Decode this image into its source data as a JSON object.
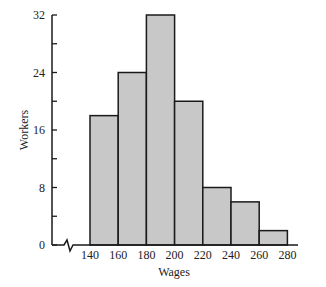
{
  "chart_data": {
    "type": "bar",
    "subtype": "histogram",
    "title": "",
    "xlabel": "Wages",
    "ylabel": "Workers",
    "bin_edges": [
      140,
      160,
      180,
      200,
      220,
      240,
      260,
      280
    ],
    "categories": [
      "140-160",
      "160-180",
      "180-200",
      "200-220",
      "220-240",
      "240-260",
      "260-280"
    ],
    "values": [
      18,
      24,
      32,
      20,
      8,
      6,
      2
    ],
    "x_ticks": [
      "140",
      "160",
      "180",
      "200",
      "220",
      "240",
      "260",
      "280"
    ],
    "y_ticks": [
      "0",
      "8",
      "16",
      "24",
      "32"
    ],
    "ylim": [
      0,
      32
    ],
    "x_axis_break": true,
    "grid": false,
    "legend": null,
    "bar_color": "#c8c8c8",
    "edge_color": "#1a1a1a"
  }
}
